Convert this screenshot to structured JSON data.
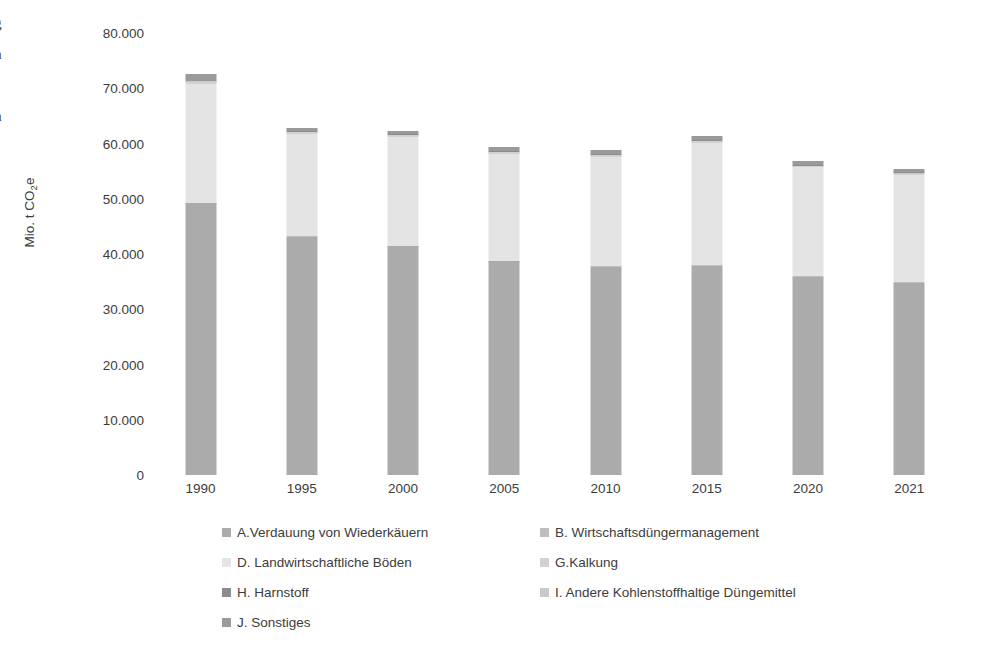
{
  "edge_text_fragments": [
    "g",
    "n",
    ".",
    "n"
  ],
  "chart_data": {
    "type": "bar",
    "stacked": true,
    "title": "",
    "subtitle": "",
    "xlabel": "",
    "ylabel": "Mio. t CO2e",
    "ylabel_display": "Mio. t CO",
    "ylabel_sub": "2",
    "ylabel_tail": "e",
    "categories": [
      "1990",
      "1995",
      "2000",
      "2005",
      "2010",
      "2015",
      "2020",
      "2021"
    ],
    "ylim": [
      0,
      80000
    ],
    "ytick_step": 10000,
    "ytick_labels": [
      "80.000",
      "70.000",
      "60.000",
      "50.000",
      "40.000",
      "30.000",
      "20.000",
      "10.000",
      "0"
    ],
    "ytick_values": [
      80000,
      70000,
      60000,
      50000,
      40000,
      30000,
      20000,
      10000,
      0
    ],
    "grid": false,
    "legend_position": "bottom",
    "series": [
      {
        "name": "A.Verdauung von Wiederkäuern",
        "key": "A",
        "color": "#ABABAB",
        "values": [
          49200,
          43100,
          41400,
          38700,
          37700,
          37900,
          35900,
          34800
        ]
      },
      {
        "name": "B. Wirtschaftsdüngermanagement",
        "key": "B",
        "color": "#BFBFBF",
        "values": [
          100,
          90,
          90,
          85,
          85,
          85,
          80,
          80
        ]
      },
      {
        "name": "D. Landwirtschaftliche Böden",
        "key": "D",
        "color": "#E4E4E4",
        "values": [
          21400,
          18500,
          19700,
          19300,
          19800,
          22100,
          19700,
          19400
        ]
      },
      {
        "name": "G.Kalkung",
        "key": "G",
        "color": "#D2D2D2",
        "values": [
          500,
          380,
          300,
          320,
          300,
          310,
          290,
          280
        ]
      },
      {
        "name": "H. Harnstoff",
        "key": "H",
        "color": "#8C8C8C",
        "values": [
          130,
          110,
          120,
          130,
          150,
          160,
          170,
          170
        ]
      },
      {
        "name": "I. Andere Kohlenstoffhaltige Düngemittel",
        "key": "I",
        "color": "#C9C9C9",
        "values": [
          60,
          50,
          50,
          50,
          50,
          50,
          50,
          50
        ]
      },
      {
        "name": "J. Sonstiges",
        "key": "J",
        "color": "#9A9A9A",
        "values": [
          1110,
          570,
          540,
          715,
          715,
          695,
          610,
          620
        ]
      }
    ],
    "totals": [
      72500,
      62800,
      62200,
      59300,
      58800,
      61300,
      56800,
      55400
    ]
  },
  "legend": {
    "items": [
      {
        "label": "A.Verdauung von Wiederkäuern",
        "color": "#ABABAB",
        "col": 0,
        "row": 0
      },
      {
        "label": "B. Wirtschaftsdüngermanagement",
        "color": "#BFBFBF",
        "col": 1,
        "row": 0
      },
      {
        "label": "D. Landwirtschaftliche Böden",
        "color": "#E4E4E4",
        "col": 0,
        "row": 1
      },
      {
        "label": "G.Kalkung",
        "color": "#D2D2D2",
        "col": 1,
        "row": 1
      },
      {
        "label": "H. Harnstoff",
        "color": "#8C8C8C",
        "col": 0,
        "row": 2
      },
      {
        "label": "I. Andere Kohlenstoffhaltige Düngemittel",
        "color": "#C9C9C9",
        "col": 1,
        "row": 2
      },
      {
        "label": "J. Sonstiges",
        "color": "#9A9A9A",
        "col": 0,
        "row": 3
      }
    ]
  }
}
